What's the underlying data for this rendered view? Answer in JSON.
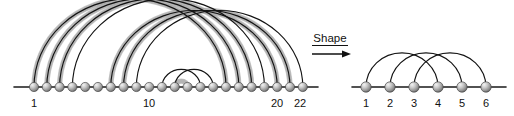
{
  "figure": {
    "background": "#ffffff"
  },
  "colors": {
    "node_fill_light": "#e6e6e6",
    "node_fill_mid": "#a8a8a8",
    "node_fill_dark": "#6e6e6e",
    "node_stroke": "#4a4a4a",
    "arc_thin": "#131313",
    "arc_thick": "#b4b4b4",
    "axis": "#1a1a1a",
    "text": "#111111"
  },
  "operator": {
    "label": "Shape",
    "icon": "right-arrow-icon",
    "x": 330,
    "text_y": 42,
    "arrow_y": 54
  },
  "left_diagram": {
    "name": "source-arc-diagram",
    "node_count": 22,
    "axis": {
      "x1": 14,
      "x2": 318,
      "y": 87
    },
    "node_start_x": 34,
    "node_spacing": 12.8,
    "node_y": 87,
    "node_radius": 4.6,
    "visible_labels": [
      {
        "text": "1",
        "index": 1,
        "x": 34,
        "y": 107
      },
      {
        "text": "10",
        "index": 10,
        "x": 149,
        "y": 107
      },
      {
        "text": "20",
        "index": 20,
        "x": 277,
        "y": 107
      },
      {
        "text": "22",
        "index": 22,
        "x": 300,
        "y": 107
      }
    ],
    "thick_arcs": [
      {
        "from": 1,
        "to": 16
      },
      {
        "from": 2,
        "to": 17
      },
      {
        "from": 3,
        "to": 18
      },
      {
        "from": 7,
        "to": 20
      },
      {
        "from": 8,
        "to": 21
      },
      {
        "from": 12,
        "to": 13
      }
    ],
    "thin_arcs": [
      {
        "from": 1,
        "to": 16
      },
      {
        "from": 2,
        "to": 17
      },
      {
        "from": 3,
        "to": 18
      },
      {
        "from": 4,
        "to": 19
      },
      {
        "from": 7,
        "to": 20
      },
      {
        "from": 8,
        "to": 21
      },
      {
        "from": 9,
        "to": 22
      },
      {
        "from": 11,
        "to": 14
      },
      {
        "from": 12,
        "to": 15
      }
    ]
  },
  "right_diagram": {
    "name": "shape-arc-diagram",
    "node_count": 6,
    "axis": {
      "x1": 352,
      "x2": 506,
      "y": 87
    },
    "node_start_x": 366,
    "node_spacing": 24,
    "node_y": 87,
    "node_radius": 5.2,
    "labels": [
      "1",
      "2",
      "3",
      "4",
      "5",
      "6"
    ],
    "label_y": 107,
    "arcs": [
      {
        "from": 1,
        "to": 4
      },
      {
        "from": 2,
        "to": 5
      },
      {
        "from": 3,
        "to": 6
      }
    ]
  }
}
